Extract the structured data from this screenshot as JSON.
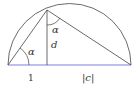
{
  "diagram": {
    "type": "semicircle-right-triangle",
    "labels": {
      "alpha_lower": "α",
      "alpha_upper": "α",
      "height": "d",
      "left_segment": "1",
      "right_segment": "|c|"
    },
    "colors": {
      "stroke": "#444444",
      "baseline": "#8080e0",
      "text": "#333333"
    },
    "geometry": {
      "baseline_y": 65,
      "left_x": 8,
      "right_x": 131,
      "foot_x": 47,
      "apex": [
        47,
        10
      ]
    }
  }
}
